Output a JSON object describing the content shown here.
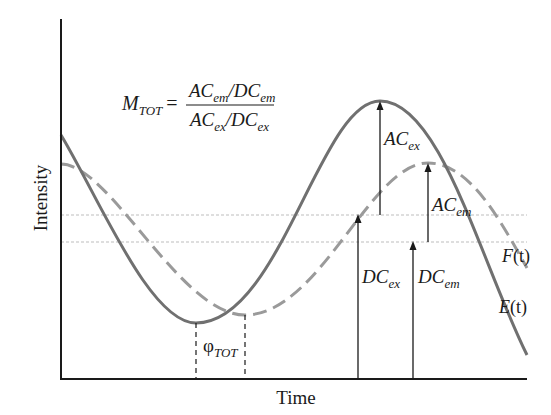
{
  "diagram": {
    "axes": {
      "x_label": "Time",
      "y_label": "Intensity"
    },
    "formula": {
      "lhs_main": "M",
      "lhs_sub": "TOT",
      "equals": "=",
      "numerator": {
        "ac": "AC",
        "ac_sub": "em",
        "slash": "/",
        "dc": "DC",
        "dc_sub": "em"
      },
      "denominator": {
        "ac": "AC",
        "ac_sub": "ex",
        "slash": "/",
        "dc": "DC",
        "dc_sub": "ex"
      }
    },
    "curves": [
      {
        "name": "E(t)",
        "label_main": "E",
        "label_arg": "(t)",
        "style": "solid",
        "color": "#707070",
        "role": "excitation"
      },
      {
        "name": "F(t)",
        "label_main": "F",
        "label_arg": "(t)",
        "style": "dashed",
        "color": "#9a9a9a",
        "role": "emission"
      }
    ],
    "annotations": {
      "ac_ex": {
        "main": "AC",
        "sub": "ex"
      },
      "ac_em": {
        "main": "AC",
        "sub": "em"
      },
      "dc_ex": {
        "main": "DC",
        "sub": "ex"
      },
      "dc_em": {
        "main": "DC",
        "sub": "em"
      },
      "phase": {
        "main": "φ",
        "sub": "TOT"
      }
    },
    "colors": {
      "axis": "#1a1a1a",
      "solid_curve": "#707070",
      "dashed_curve": "#9a9a9a",
      "dotted_guides": "#bdbdbd",
      "arrows": "#1a1a1a"
    }
  }
}
